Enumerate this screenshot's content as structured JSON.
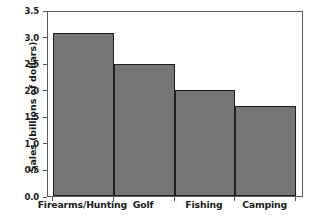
{
  "chart_data": {
    "type": "bar",
    "title": "",
    "subtitle": "",
    "xlabel": "",
    "ylabel": "Sales (billions of dollars)",
    "categories": [
      "Firearms/Hunting",
      "Golf",
      "Fishing",
      "Camping"
    ],
    "values": [
      3.11,
      2.51,
      2.01,
      1.72
    ],
    "series": [
      {
        "name": "Sales",
        "values": [
          3.11,
          2.51,
          2.01,
          1.72
        ]
      }
    ],
    "ylim": [
      0.0,
      3.5
    ],
    "yticks": [
      "0.0",
      "0.5",
      "1.0",
      "1.5",
      "2.0",
      "2.5",
      "3.0",
      "3.5"
    ],
    "ytick_values": [
      0.0,
      0.5,
      1.0,
      1.5,
      2.0,
      2.5,
      3.0,
      3.5
    ],
    "grid": false,
    "legend": false,
    "legend_position": "none",
    "bar_fill_color": "#757575",
    "bar_edge_color": "#1f1f1f",
    "frame_color": "#5a5a5a",
    "background_color": "#ffffff",
    "text_color": "#1a1a1a"
  }
}
